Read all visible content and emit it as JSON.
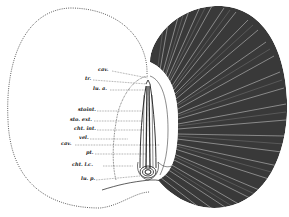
{
  "figure": {
    "type": "anatomical-diagram",
    "colors": {
      "ink": "#1a1a1a",
      "background": "#ffffff",
      "lamellae_dark": "#2b2b2b"
    }
  },
  "labels": [
    {
      "id": "cav-top",
      "text": "cav.",
      "x": 98,
      "y": 68,
      "line_to": [
        148,
        78
      ]
    },
    {
      "id": "tr",
      "text": "tr.",
      "x": 85,
      "y": 77,
      "line_to": [
        147,
        84
      ]
    },
    {
      "id": "lu-a",
      "text": "lu. a.",
      "x": 93,
      "y": 87,
      "line_to": [
        146,
        90
      ]
    },
    {
      "id": "stoint",
      "text": "stoint.",
      "x": 79,
      "y": 108,
      "line_to": [
        142,
        111
      ]
    },
    {
      "id": "sto-ext",
      "text": "sto. ext.",
      "x": 71,
      "y": 118,
      "line_to": [
        143,
        121
      ]
    },
    {
      "id": "cht-int",
      "text": "cht. int.",
      "x": 75,
      "y": 127,
      "line_to": [
        144,
        130
      ]
    },
    {
      "id": "vel",
      "text": "vel.",
      "x": 79,
      "y": 136,
      "line_to": [
        128,
        138
      ]
    },
    {
      "id": "cav-mid",
      "text": "cav.",
      "x": 62,
      "y": 142,
      "line_to": [
        160,
        144
      ]
    },
    {
      "id": "pt",
      "text": "pt.",
      "x": 86,
      "y": 151,
      "line_to": [
        146,
        153
      ]
    },
    {
      "id": "cht-lc",
      "text": "cht.  l.c.",
      "x": 72,
      "y": 163,
      "line_to": [
        133,
        165
      ]
    },
    {
      "id": "lu-p",
      "text": "lu. p.",
      "x": 81,
      "y": 177,
      "line_to": [
        140,
        175
      ]
    }
  ]
}
